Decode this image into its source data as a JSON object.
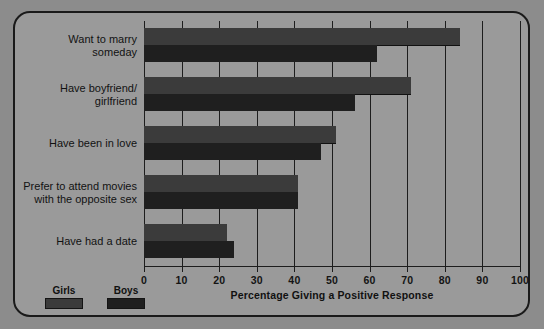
{
  "chart_data": {
    "type": "bar",
    "orientation": "horizontal",
    "title": "",
    "xlabel": "Percentage Giving a Positive Response",
    "ylabel": "",
    "xlim": [
      0,
      100
    ],
    "xticks": [
      0,
      10,
      20,
      30,
      40,
      50,
      60,
      70,
      80,
      90,
      100
    ],
    "grid": true,
    "legend_position": "bottom-left",
    "categories": [
      "Want to marry someday",
      "Have boyfriend/ girlfriend",
      "Have been in love",
      "Prefer to attend movies with the opposite sex",
      "Have had a date"
    ],
    "category_lines": [
      [
        "Want to marry",
        "someday"
      ],
      [
        "Have boyfriend/",
        "girlfriend"
      ],
      [
        "Have been in love"
      ],
      [
        "Prefer to attend movies",
        "with the opposite sex"
      ],
      [
        "Have had a date"
      ]
    ],
    "series": [
      {
        "name": "Girls",
        "color": "#3b3b3b",
        "values": [
          84,
          71,
          51,
          41,
          22
        ]
      },
      {
        "name": "Boys",
        "color": "#1f1f1f",
        "values": [
          62,
          56,
          47,
          41,
          24
        ]
      }
    ]
  },
  "axis": {
    "tick_labels": [
      "0",
      "10",
      "20",
      "30",
      "40",
      "50",
      "60",
      "70",
      "80",
      "90",
      "100"
    ],
    "title": "Percentage Giving a Positive Response"
  },
  "legend": {
    "items": [
      {
        "label": "Girls",
        "color": "#3b3b3b"
      },
      {
        "label": "Boys",
        "color": "#1f1f1f"
      }
    ]
  },
  "colors": {
    "page_background": "#8c8c8c",
    "card_background": "#9a9a9a",
    "border": "#1a1a1a",
    "girls_bar": "#3b3b3b",
    "boys_bar": "#1f1f1f",
    "text": "#121212"
  }
}
